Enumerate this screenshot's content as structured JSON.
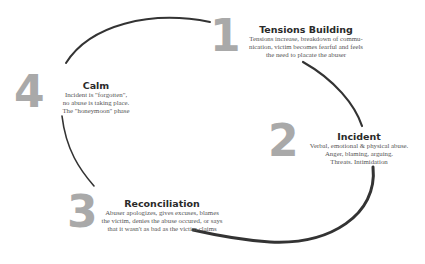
{
  "diagram": {
    "type": "cycle",
    "colors": {
      "numerals": "#a9a9a9",
      "arrows": "#333333",
      "title_text": "#2a2a2a",
      "body_text": "#555555"
    },
    "stages": [
      {
        "number": "1",
        "title": "Tensions Building",
        "desc_lines": [
          "Tensions increase, breakdown of commu-",
          "nication, victim becomes fearful and feels",
          "the need to placate the abuser"
        ]
      },
      {
        "number": "2",
        "title": "Incident",
        "desc_lines": [
          "Verbal, emotional & physical abuse.",
          "Anger, blaming, arguing.",
          "Threats.  Intimidation"
        ]
      },
      {
        "number": "3",
        "title": "Reconciliation",
        "desc_lines": [
          "Abuser apologizes, gives excuses, blames",
          "the victim, denies the abuse occured, or says",
          "that it wasn't as bad as the victim claims"
        ]
      },
      {
        "number": "4",
        "title": "Calm",
        "desc_lines": [
          "Incident is \"forgotten\",",
          "no abuse is taking place.",
          "The \"honeymoon\" phase"
        ]
      }
    ]
  }
}
